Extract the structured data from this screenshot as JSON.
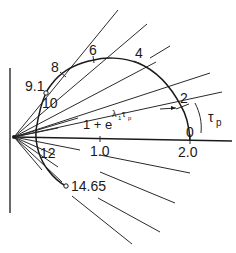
{
  "diagram": {
    "curve_label": {
      "base": "1 + e",
      "exponent": "λ",
      "exponent_sub": "1",
      "exponent_tail": "τ",
      "exponent_tail_sub": "p"
    },
    "param_label": {
      "symbol": "τ",
      "sub": "p"
    },
    "axis_ticks": [
      {
        "label": "1.0",
        "value": 1.0
      },
      {
        "label": "2.0",
        "value": 2.0
      }
    ],
    "curve_points": [
      {
        "label": "0",
        "tau": 0
      },
      {
        "label": "2",
        "tau": 2
      },
      {
        "label": "4",
        "tau": 4
      },
      {
        "label": "6",
        "tau": 6
      },
      {
        "label": "8",
        "tau": 8
      },
      {
        "label": "9.1",
        "tau": 9.1,
        "marker": "open-circle"
      },
      {
        "label": "10",
        "tau": 10
      },
      {
        "label": "12",
        "tau": 12
      },
      {
        "label": "14.65",
        "tau": 14.65,
        "marker": "open-circle"
      }
    ],
    "colors": {
      "ink": "#1a1a1a",
      "background": "#ffffff"
    }
  }
}
